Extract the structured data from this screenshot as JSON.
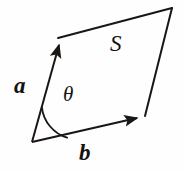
{
  "figure": {
    "background_color": "#fefefe",
    "stroke_color": "#1a1613",
    "labels": {
      "vector_a": "a",
      "vector_b": "b",
      "area": "S",
      "angle": "θ"
    },
    "geometry": {
      "origin_vertex": [
        32,
        142
      ],
      "vertex_a_tip": [
        58,
        38
      ],
      "vertex_opposite": [
        172,
        8
      ],
      "vertex_b_tip": [
        144,
        116
      ],
      "arc_radius": 36,
      "stroke_width": 2.0
    }
  }
}
